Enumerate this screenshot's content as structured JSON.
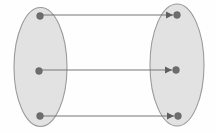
{
  "diagram": {
    "type": "set-mapping-diagram",
    "title": "",
    "canvas": {
      "width": 216,
      "height": 134,
      "background_color": "#fefefe"
    },
    "palette": {
      "ellipse_fill": "#e2e2e2",
      "ellipse_stroke": "#9a9a9a",
      "dot_fill": "#6e6e6e",
      "line_stroke": "#777777",
      "arrowhead_fill": "#5f5f5f"
    },
    "sets": [
      {
        "id": "domain-set",
        "label": "",
        "shape": "ellipse",
        "cx": 40.5,
        "cy": 67,
        "rx": 26.5,
        "ry": 59.5,
        "elements": [
          {
            "id": "domain-element-1",
            "label": "",
            "cx": 40,
            "cy": 16,
            "r": 3.4
          },
          {
            "id": "domain-element-2",
            "label": "",
            "cx": 39,
            "cy": 71,
            "r": 3.4
          },
          {
            "id": "domain-element-3",
            "label": "",
            "cx": 40,
            "cy": 116,
            "r": 3.4
          }
        ]
      },
      {
        "id": "codomain-set",
        "label": "",
        "shape": "ellipse",
        "cx": 177,
        "cy": 65,
        "rx": 27,
        "ry": 61,
        "elements": [
          {
            "id": "codomain-element-1",
            "label": "",
            "cx": 177,
            "cy": 15,
            "r": 3.4
          },
          {
            "id": "codomain-element-2",
            "label": "",
            "cx": 176,
            "cy": 70,
            "r": 3.4
          },
          {
            "id": "codomain-element-3",
            "label": "",
            "cx": 178,
            "cy": 116,
            "r": 3.4
          }
        ]
      }
    ],
    "mappings": [
      {
        "id": "mapping-1",
        "label": "",
        "from": "domain-element-1",
        "to": "codomain-element-1",
        "x1": 43,
        "y1": 15,
        "x2": 173,
        "y2": 15
      },
      {
        "id": "mapping-2",
        "label": "",
        "from": "domain-element-2",
        "to": "codomain-element-2",
        "x1": 42,
        "y1": 70,
        "x2": 172,
        "y2": 70
      },
      {
        "id": "mapping-3",
        "label": "",
        "from": "domain-element-3",
        "to": "codomain-element-3",
        "x1": 43,
        "y1": 116,
        "x2": 174,
        "y2": 116
      }
    ]
  }
}
